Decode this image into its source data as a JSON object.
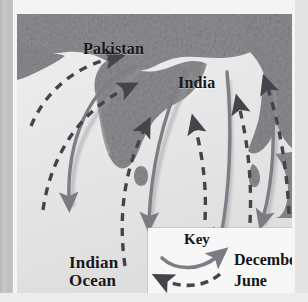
{
  "figure": {
    "type": "map-diagram",
    "map_labels": [
      {
        "name": "pakistan",
        "text": "Pakistan"
      },
      {
        "name": "india",
        "text": "India"
      },
      {
        "name": "indian-ocean",
        "line1": "Indian",
        "line2": "Ocean"
      }
    ],
    "legend": {
      "title": "Key",
      "entries": [
        {
          "name": "december",
          "label": "December",
          "style": "solid-curved-arrow",
          "color": "#7a7680"
        },
        {
          "name": "june",
          "label": "June",
          "style": "dashed-curved-arrow",
          "color": "#4d4a52"
        }
      ]
    },
    "colors": {
      "land": "#8d8d91",
      "ocean": "#e8e8e8",
      "solid_arrow": "#807c86",
      "dashed_arrow": "#4a474f",
      "label_text": "#17171a",
      "legend_bg": "#f7f7f7",
      "page_bg": "#d9d9d9",
      "frame": "#f4f4f4"
    }
  }
}
